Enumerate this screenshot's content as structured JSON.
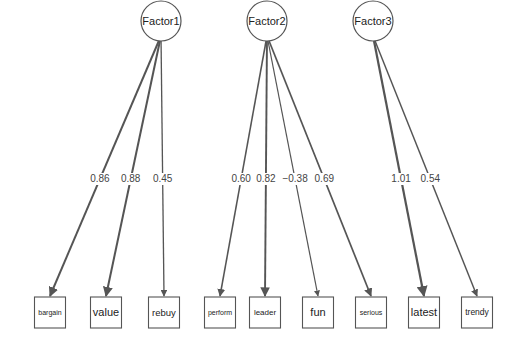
{
  "diagram": {
    "type": "factor-analysis-path-diagram",
    "factors": [
      {
        "id": "f1",
        "label": "Factor1",
        "cx": 161,
        "cy": 21
      },
      {
        "id": "f2",
        "label": "Factor2",
        "cx": 267,
        "cy": 21
      },
      {
        "id": "f3",
        "label": "Factor3",
        "cx": 373,
        "cy": 21
      }
    ],
    "indicators": [
      {
        "id": "bargain",
        "label": "bargain",
        "cx": 50,
        "size": 7
      },
      {
        "id": "value",
        "label": "value",
        "cx": 106,
        "size": 11
      },
      {
        "id": "rebuy",
        "label": "rebuy",
        "cx": 164,
        "size": 9.5
      },
      {
        "id": "perform",
        "label": "perform",
        "cx": 220,
        "size": 7
      },
      {
        "id": "leader",
        "label": "leader",
        "cx": 265,
        "size": 8
      },
      {
        "id": "fun",
        "label": "fun",
        "cx": 318,
        "size": 11
      },
      {
        "id": "serious",
        "label": "serious",
        "cx": 371,
        "size": 7
      },
      {
        "id": "latest",
        "label": "latest",
        "cx": 424,
        "size": 11
      },
      {
        "id": "trendy",
        "label": "trendy",
        "cx": 477,
        "size": 8.5
      }
    ],
    "loadings": [
      {
        "from": "f1",
        "to": "bargain",
        "value": "0.86",
        "lx": 98
      },
      {
        "from": "f1",
        "to": "value",
        "value": "0.88",
        "lx": 132
      },
      {
        "from": "f1",
        "to": "rebuy",
        "value": "0.45",
        "lx": 160
      },
      {
        "from": "f2",
        "to": "perform",
        "value": "0.60",
        "lx": 239
      },
      {
        "from": "f2",
        "to": "leader",
        "value": "0.82",
        "lx": 265
      },
      {
        "from": "f2",
        "to": "fun",
        "value": "−0.38",
        "lx": 293
      },
      {
        "from": "f2",
        "to": "serious",
        "value": "0.69",
        "lx": 321
      },
      {
        "from": "f3",
        "to": "latest",
        "value": "1.01",
        "lx": 398
      },
      {
        "from": "f3",
        "to": "trendy",
        "value": "0.54",
        "lx": 425
      }
    ],
    "label_y": 182,
    "box_top": 297,
    "box_size": 31,
    "factor_radius": 20
  }
}
